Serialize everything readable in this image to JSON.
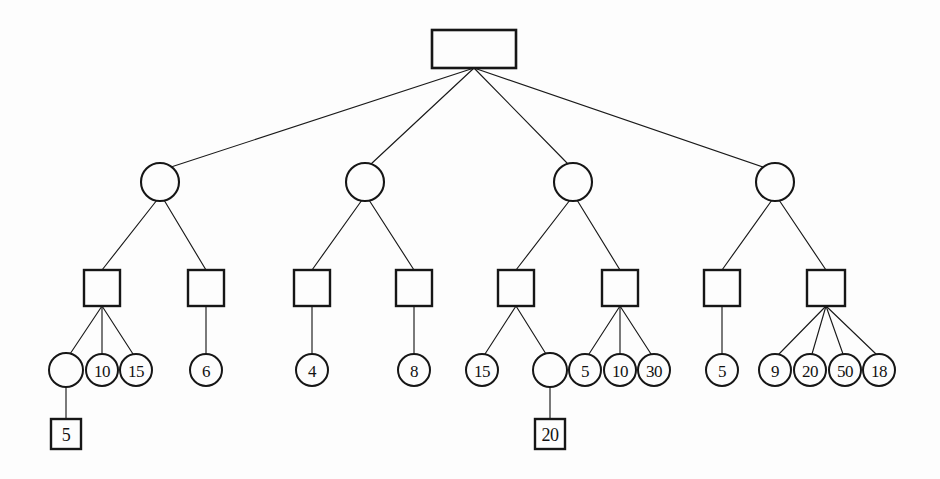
{
  "diagram": {
    "background_color": "#fdfdfd",
    "stroke_color": "#161616",
    "canvas": {
      "width": 940,
      "height": 479
    },
    "levels": [
      {
        "level": 1,
        "shape": "rectangle",
        "y": 49,
        "count": 1
      },
      {
        "level": 2,
        "shape": "circle",
        "y": 182,
        "count": 4
      },
      {
        "level": 3,
        "shape": "square",
        "y": 288,
        "count": 8
      },
      {
        "level": 4,
        "shape": "circle",
        "y": 370,
        "count": 17
      },
      {
        "level": 5,
        "shape": "square",
        "y": 434,
        "count": 2
      }
    ],
    "nodes": [
      {
        "id": "root",
        "shape": "rectangle",
        "label": "",
        "x": 474,
        "y": 49,
        "w": 84,
        "h": 38,
        "level": 1
      },
      {
        "id": "c1",
        "shape": "circle",
        "label": "",
        "x": 160,
        "y": 182,
        "r": 19,
        "level": 2
      },
      {
        "id": "c2",
        "shape": "circle",
        "label": "",
        "x": 365,
        "y": 182,
        "r": 19,
        "level": 2
      },
      {
        "id": "c3",
        "shape": "circle",
        "label": "",
        "x": 573,
        "y": 182,
        "r": 19,
        "level": 2
      },
      {
        "id": "c4",
        "shape": "circle",
        "label": "",
        "x": 775,
        "y": 182,
        "r": 19,
        "level": 2
      },
      {
        "id": "s1",
        "shape": "square",
        "label": "",
        "x": 102,
        "y": 288,
        "w": 36,
        "h": 36,
        "level": 3
      },
      {
        "id": "s2",
        "shape": "square",
        "label": "",
        "x": 206,
        "y": 288,
        "w": 36,
        "h": 36,
        "level": 3
      },
      {
        "id": "s3",
        "shape": "square",
        "label": "",
        "x": 312,
        "y": 288,
        "w": 36,
        "h": 36,
        "level": 3
      },
      {
        "id": "s4",
        "shape": "square",
        "label": "",
        "x": 414,
        "y": 288,
        "w": 36,
        "h": 36,
        "level": 3
      },
      {
        "id": "s5",
        "shape": "square",
        "label": "",
        "x": 516,
        "y": 288,
        "w": 36,
        "h": 36,
        "level": 3
      },
      {
        "id": "s6",
        "shape": "square",
        "label": "",
        "x": 620,
        "y": 288,
        "w": 36,
        "h": 36,
        "level": 3
      },
      {
        "id": "s7",
        "shape": "square",
        "label": "",
        "x": 722,
        "y": 288,
        "w": 36,
        "h": 36,
        "level": 3
      },
      {
        "id": "s8",
        "shape": "square",
        "label": "",
        "x": 826,
        "y": 288,
        "w": 38,
        "h": 36,
        "level": 3
      },
      {
        "id": "l1",
        "shape": "circle",
        "label": "",
        "x": 66,
        "y": 370,
        "r": 17,
        "level": 4
      },
      {
        "id": "l2",
        "shape": "circle",
        "label": "10",
        "x": 102,
        "y": 370,
        "r": 16,
        "level": 4
      },
      {
        "id": "l3",
        "shape": "circle",
        "label": "15",
        "x": 136,
        "y": 370,
        "r": 16,
        "level": 4
      },
      {
        "id": "l4",
        "shape": "circle",
        "label": "6",
        "x": 206,
        "y": 370,
        "r": 16,
        "level": 4
      },
      {
        "id": "l5",
        "shape": "circle",
        "label": "4",
        "x": 312,
        "y": 370,
        "r": 16,
        "level": 4
      },
      {
        "id": "l6",
        "shape": "circle",
        "label": "8",
        "x": 414,
        "y": 370,
        "r": 16,
        "level": 4
      },
      {
        "id": "l7",
        "shape": "circle",
        "label": "15",
        "x": 482,
        "y": 370,
        "r": 16,
        "level": 4
      },
      {
        "id": "l8",
        "shape": "circle",
        "label": "",
        "x": 550,
        "y": 370,
        "r": 17,
        "level": 4
      },
      {
        "id": "l9",
        "shape": "circle",
        "label": "5",
        "x": 585,
        "y": 370,
        "r": 16,
        "level": 4
      },
      {
        "id": "l10",
        "shape": "circle",
        "label": "10",
        "x": 620,
        "y": 370,
        "r": 16,
        "level": 4
      },
      {
        "id": "l11",
        "shape": "circle",
        "label": "30",
        "x": 654,
        "y": 370,
        "r": 16,
        "level": 4
      },
      {
        "id": "l12",
        "shape": "circle",
        "label": "5",
        "x": 722,
        "y": 370,
        "r": 16,
        "level": 4
      },
      {
        "id": "l13",
        "shape": "circle",
        "label": "9",
        "x": 775,
        "y": 370,
        "r": 16,
        "level": 4
      },
      {
        "id": "l14",
        "shape": "circle",
        "label": "20",
        "x": 810,
        "y": 370,
        "r": 16,
        "level": 4
      },
      {
        "id": "l15",
        "shape": "circle",
        "label": "50",
        "x": 845,
        "y": 370,
        "r": 16,
        "level": 4
      },
      {
        "id": "l16",
        "shape": "circle",
        "label": "18",
        "x": 879,
        "y": 370,
        "r": 16,
        "level": 4
      },
      {
        "id": "b1",
        "shape": "square",
        "label": "5",
        "x": 66,
        "y": 434,
        "w": 30,
        "h": 30,
        "level": 5
      },
      {
        "id": "b2",
        "shape": "square",
        "label": "20",
        "x": 550,
        "y": 434,
        "w": 30,
        "h": 30,
        "level": 5
      }
    ],
    "edges": [
      {
        "from": "root",
        "to": "c1",
        "x1": 474,
        "y1": 68,
        "x2": 168,
        "y2": 168
      },
      {
        "from": "root",
        "to": "c2",
        "x1": 474,
        "y1": 68,
        "x2": 371,
        "y2": 164
      },
      {
        "from": "root",
        "to": "c3",
        "x1": 474,
        "y1": 68,
        "x2": 568,
        "y2": 164
      },
      {
        "from": "root",
        "to": "c4",
        "x1": 474,
        "y1": 68,
        "x2": 766,
        "y2": 168
      },
      {
        "from": "c1",
        "to": "s1",
        "x1": 157,
        "y1": 200,
        "x2": 102,
        "y2": 270
      },
      {
        "from": "c1",
        "to": "s2",
        "x1": 164,
        "y1": 200,
        "x2": 206,
        "y2": 270
      },
      {
        "from": "c2",
        "to": "s3",
        "x1": 362,
        "y1": 200,
        "x2": 312,
        "y2": 270
      },
      {
        "from": "c2",
        "to": "s4",
        "x1": 369,
        "y1": 200,
        "x2": 414,
        "y2": 270
      },
      {
        "from": "c3",
        "to": "s5",
        "x1": 570,
        "y1": 200,
        "x2": 516,
        "y2": 270
      },
      {
        "from": "c3",
        "to": "s6",
        "x1": 577,
        "y1": 200,
        "x2": 620,
        "y2": 270
      },
      {
        "from": "c4",
        "to": "s7",
        "x1": 772,
        "y1": 200,
        "x2": 722,
        "y2": 270
      },
      {
        "from": "c4",
        "to": "s8",
        "x1": 779,
        "y1": 200,
        "x2": 826,
        "y2": 270
      },
      {
        "from": "s1",
        "to": "l1",
        "x1": 102,
        "y1": 306,
        "x2": 70,
        "y2": 354
      },
      {
        "from": "s1",
        "to": "l2",
        "x1": 102,
        "y1": 306,
        "x2": 102,
        "y2": 354
      },
      {
        "from": "s1",
        "to": "l3",
        "x1": 102,
        "y1": 306,
        "x2": 133,
        "y2": 354
      },
      {
        "from": "s2",
        "to": "l4",
        "x1": 206,
        "y1": 306,
        "x2": 206,
        "y2": 354
      },
      {
        "from": "s3",
        "to": "l5",
        "x1": 312,
        "y1": 306,
        "x2": 312,
        "y2": 354
      },
      {
        "from": "s4",
        "to": "l6",
        "x1": 414,
        "y1": 306,
        "x2": 414,
        "y2": 354
      },
      {
        "from": "s5",
        "to": "l7",
        "x1": 516,
        "y1": 306,
        "x2": 485,
        "y2": 354
      },
      {
        "from": "s5",
        "to": "l8",
        "x1": 516,
        "y1": 306,
        "x2": 546,
        "y2": 354
      },
      {
        "from": "s6",
        "to": "l9",
        "x1": 620,
        "y1": 306,
        "x2": 589,
        "y2": 354
      },
      {
        "from": "s6",
        "to": "l10",
        "x1": 620,
        "y1": 306,
        "x2": 620,
        "y2": 354
      },
      {
        "from": "s6",
        "to": "l11",
        "x1": 620,
        "y1": 306,
        "x2": 651,
        "y2": 354
      },
      {
        "from": "s7",
        "to": "l12",
        "x1": 722,
        "y1": 306,
        "x2": 722,
        "y2": 354
      },
      {
        "from": "s8",
        "to": "l13",
        "x1": 826,
        "y1": 306,
        "x2": 779,
        "y2": 354
      },
      {
        "from": "s8",
        "to": "l14",
        "x1": 826,
        "y1": 306,
        "x2": 812,
        "y2": 354
      },
      {
        "from": "s8",
        "to": "l15",
        "x1": 826,
        "y1": 306,
        "x2": 843,
        "y2": 354
      },
      {
        "from": "s8",
        "to": "l16",
        "x1": 826,
        "y1": 306,
        "x2": 876,
        "y2": 354
      },
      {
        "from": "l1",
        "to": "b1",
        "x1": 66,
        "y1": 387,
        "x2": 66,
        "y2": 419
      },
      {
        "from": "l8",
        "to": "b2",
        "x1": 550,
        "y1": 387,
        "x2": 550,
        "y2": 419
      }
    ]
  }
}
